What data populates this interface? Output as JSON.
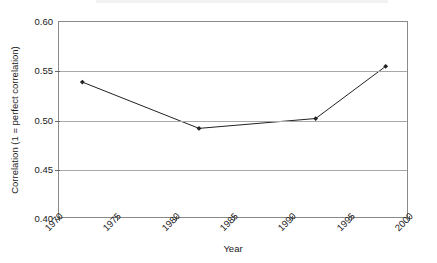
{
  "chart_data": {
    "type": "line",
    "title": "",
    "xlabel": "Year",
    "ylabel": "Correlation (1 = perfect correlation)",
    "xlim": [
      1970,
      2000
    ],
    "ylim": [
      0.4,
      0.6
    ],
    "grid": true,
    "legend": "none",
    "x_ticks": [
      "1970",
      "1975",
      "1980",
      "1985",
      "1990",
      "1995",
      "2000"
    ],
    "x_tick_values": [
      1970,
      1975,
      1980,
      1985,
      1990,
      1995,
      2000
    ],
    "y_ticks": [
      "0.60",
      "0.55",
      "0.50",
      "0.45",
      "0.40"
    ],
    "y_tick_values": [
      0.6,
      0.55,
      0.5,
      0.45,
      0.4
    ],
    "series": [
      {
        "name": "Correlation",
        "marker": "filled-diamond",
        "color": "#222222",
        "x": [
          1972,
          1982,
          1992,
          1998
        ],
        "values": [
          0.539,
          0.492,
          0.502,
          0.555
        ]
      }
    ]
  },
  "axes": {
    "y_title": "Correlation (1 = perfect correlation)",
    "x_title": "Year"
  },
  "colors": {
    "line": "#222222",
    "grid": "#a8a8a8",
    "frame": "#8a8a8a",
    "text": "#1a1a1a",
    "background": "#ffffff"
  }
}
